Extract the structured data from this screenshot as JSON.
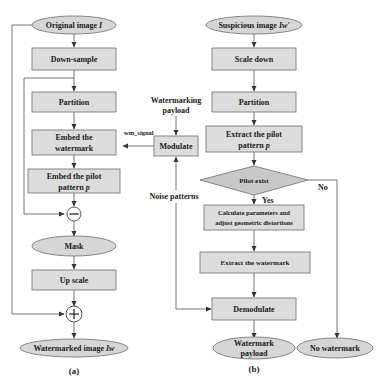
{
  "diagram_a": {
    "caption": "(a)",
    "nodes": {
      "original_image": {
        "label": "Original image ",
        "var": "I"
      },
      "down_sample": {
        "label": "Down-sample"
      },
      "partition": {
        "label": "Partition"
      },
      "embed_watermark": {
        "line1": "Embed the",
        "line2": "watermark"
      },
      "embed_pilot": {
        "line1": "Embed the pilot",
        "line2": "pattern ",
        "var": "p"
      },
      "minus_op": {
        "symbol": "−"
      },
      "mask": {
        "label": "Mask"
      },
      "up_scale": {
        "label": "Up scale"
      },
      "plus_op": {
        "symbol": "+"
      },
      "watermarked_image": {
        "label": "Watermarked image ",
        "var": "Iw"
      }
    }
  },
  "middle": {
    "watermarking_payload": {
      "line1": "Watermarking",
      "line2": "payload"
    },
    "modulate": {
      "label": "Modulate"
    },
    "wm_signal": {
      "label": "wm_signal"
    },
    "noise_patterns": {
      "label": "Noise patterns"
    }
  },
  "diagram_b": {
    "caption": "(b)",
    "nodes": {
      "suspicious_image": {
        "label": "Suspicious image ",
        "var": "Iw'"
      },
      "scale_down": {
        "label": "Scale down"
      },
      "partition": {
        "label": "Partition"
      },
      "extract_pilot": {
        "line1": "Extract the pilot",
        "line2": "pattern ",
        "var": "p"
      },
      "pilot_exist": {
        "label": "Pilot exist"
      },
      "yes": {
        "label": "Yes"
      },
      "no": {
        "label": "No"
      },
      "calculate": {
        "line1": "Calculate parameters  and",
        "line2": "adjust geometric distortions"
      },
      "extract_watermark": {
        "label": "Extract the watermark"
      },
      "demodulate": {
        "label": "Demodulate"
      },
      "watermark_payload": {
        "line1": "Watermark",
        "line2": "payload"
      },
      "no_watermark": {
        "label": "No watermark"
      }
    }
  }
}
